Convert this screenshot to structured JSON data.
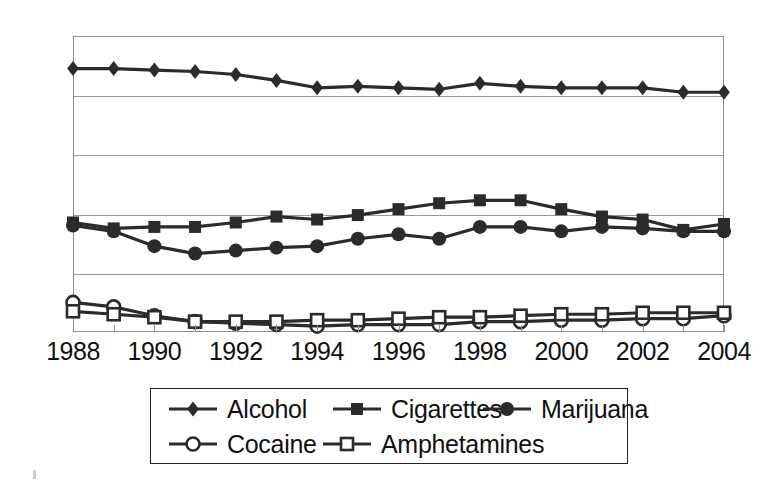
{
  "chart_data": {
    "type": "line",
    "title": "",
    "subtitle": "",
    "xlabel": "",
    "ylabel": "",
    "x": [
      1988,
      1989,
      1990,
      1991,
      1992,
      1993,
      1994,
      1995,
      1996,
      1997,
      1998,
      1999,
      2000,
      2001,
      2002,
      2003,
      2004
    ],
    "xlim": [
      1988,
      2004
    ],
    "ylim": [
      0,
      100
    ],
    "xticks": [
      "1988",
      "1990",
      "1992",
      "1994",
      "1996",
      "1998",
      "2000",
      "2002",
      "2004"
    ],
    "yticks": [
      "0",
      "20",
      "40",
      "60",
      "80",
      "100"
    ],
    "ytick_values": [
      0,
      20,
      40,
      60,
      80,
      100
    ],
    "grid": "horizontal",
    "legend_position": "bottom",
    "series": [
      {
        "name": "Alcohol",
        "marker": "filled-diamond",
        "color": "#2b2b2b",
        "values": [
          89,
          89,
          88.5,
          88,
          87,
          85,
          82.5,
          83,
          82.5,
          82,
          84,
          83,
          82.5,
          82.5,
          82.5,
          81,
          81
        ]
      },
      {
        "name": "Cigarettes",
        "marker": "filled-square",
        "color": "#2b2b2b",
        "values": [
          37,
          35,
          35.5,
          35.5,
          37,
          39,
          38,
          39.5,
          41.5,
          43.5,
          44.5,
          44.5,
          41.5,
          39,
          38,
          34.5,
          36.5
        ]
      },
      {
        "name": "Marijuana",
        "marker": "filled-circle",
        "color": "#2b2b2b",
        "values": [
          36,
          34,
          29,
          26.5,
          27.5,
          28.5,
          29,
          31.5,
          33,
          31.5,
          35.5,
          35.5,
          34,
          35.5,
          35,
          34,
          34
        ]
      },
      {
        "name": "Cocaine",
        "marker": "open-circle",
        "color": "#2b2b2b",
        "values": [
          10,
          8.5,
          5.5,
          3.5,
          3,
          2.5,
          2,
          2.5,
          2.5,
          2.5,
          3.5,
          3.5,
          4,
          4,
          4.5,
          4.5,
          5.5
        ]
      },
      {
        "name": "Amphetamines",
        "marker": "open-square",
        "color": "#2b2b2b",
        "values": [
          7,
          6,
          5,
          3.5,
          3.5,
          3.5,
          4,
          4,
          4.5,
          5,
          5,
          5.5,
          6,
          6,
          6.5,
          6.5,
          6.5
        ]
      }
    ]
  },
  "axes": {
    "y_labels": [
      "100",
      "80",
      "60",
      "40",
      "20",
      "0"
    ],
    "x_labels": [
      "1988",
      "1990",
      "1992",
      "1994",
      "1996",
      "1998",
      "2000",
      "2002",
      "2004"
    ]
  },
  "legend": {
    "row1": [
      {
        "label": "Alcohol",
        "marker": "filled-diamond"
      },
      {
        "label": "Cigarettes",
        "marker": "filled-square"
      },
      {
        "label": "Marijuana",
        "marker": "filled-circle"
      }
    ],
    "row2": [
      {
        "label": "Cocaine",
        "marker": "open-circle"
      },
      {
        "label": "Amphetamines",
        "marker": "open-square"
      }
    ]
  },
  "style": {
    "line_color": "#2b2b2b",
    "grid_color": "#9a9a9a",
    "frame_color": "#8e8e8e",
    "text_color": "#111111",
    "background": "#ffffff"
  }
}
